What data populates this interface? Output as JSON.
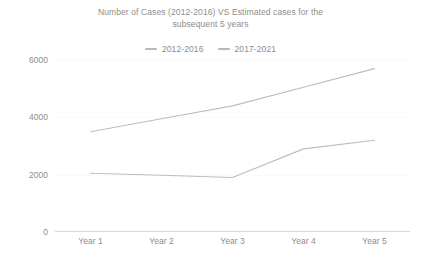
{
  "chart_data": {
    "type": "line",
    "title": "Number of Cases (2012-2016) VS Estimated cases for the subsequent 5 years",
    "title_lines": [
      "Number of Cases (2012-2016) VS Estimated cases for the",
      "subsequent 5 years"
    ],
    "xlabel": "",
    "ylabel": "",
    "categories": [
      "Year 1",
      "Year 2",
      "Year 3",
      "Year 4",
      "Year 5"
    ],
    "series": [
      {
        "name": "2012-2016",
        "values": [
          2050,
          1980,
          1900,
          2900,
          3200
        ],
        "color": "#bdbdbd"
      },
      {
        "name": "2017-2021",
        "values": [
          3500,
          3950,
          4400,
          5050,
          5700
        ],
        "color": "#bdbdbd"
      }
    ],
    "ylim": [
      0,
      6000
    ],
    "yticks": [
      0,
      2000,
      4000,
      6000
    ],
    "ytick_labels": [
      "0",
      "2000",
      "4000",
      "6000"
    ],
    "grid": true,
    "legend_position": "top-center",
    "legend": [
      "2012-2016",
      "2017-2021"
    ]
  },
  "colors": {
    "text": "#8d8d8d",
    "gridline": "#fafafa",
    "axis": "#d8d8d8",
    "line": "#bdbdbd",
    "background": "#ffffff"
  }
}
